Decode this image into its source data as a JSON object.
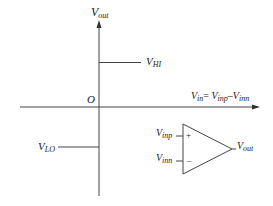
{
  "diagram": {
    "type": "comparator transfer characteristic",
    "axes": {
      "y_label_main": "V",
      "y_label_sub": "out",
      "x_label": {
        "lhs_main": "V",
        "lhs_sub": "in",
        "eq": "= ",
        "t1_main": "V",
        "t1_sub": "inp",
        "minus": "–",
        "t2_main": "V",
        "t2_sub": "inn"
      },
      "origin_label": "O"
    },
    "levels": {
      "high": {
        "main": "V",
        "sub": "HI"
      },
      "low": {
        "main": "V",
        "sub": "LO"
      }
    },
    "opamp": {
      "input_plus": {
        "main": "V",
        "sub": "inp"
      },
      "input_minus": {
        "main": "V",
        "sub": "inn"
      },
      "plus_sign": "+",
      "minus_sign": "–",
      "output": {
        "main": "V",
        "sub": "out"
      }
    },
    "colors": {
      "line": "#333333",
      "text": "#222222"
    }
  }
}
